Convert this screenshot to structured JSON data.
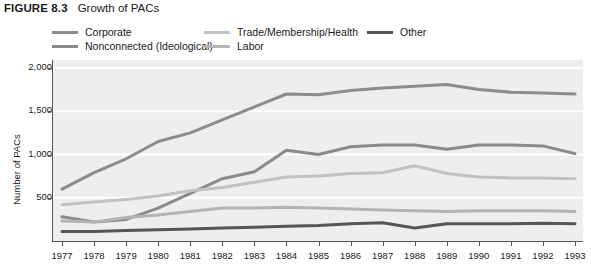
{
  "figure": {
    "number": "FIGURE 8.3",
    "title": "Growth of PACs"
  },
  "legend": {
    "position": "top",
    "items": [
      {
        "label": "Corporate",
        "color": "#8c8c8c"
      },
      {
        "label": "Nonconnected (Ideological)",
        "color": "#8a8a8a"
      },
      {
        "label": "Trade/Membership/Health",
        "color": "#c2c2c2"
      },
      {
        "label": "Labor",
        "color": "#b4b4b4"
      },
      {
        "label": "Other",
        "color": "#555555"
      }
    ]
  },
  "axes": {
    "ylabel": "Number of PACs",
    "yticks": [
      "2,000",
      "1,500",
      "1,000",
      "500"
    ],
    "ytick_values": [
      2000,
      1500,
      1000,
      500
    ],
    "xticks": [
      "1977",
      "1978",
      "1979",
      "1980",
      "1981",
      "1982",
      "1983",
      "1984",
      "1985",
      "1986",
      "1987",
      "1988",
      "1989",
      "1990",
      "1991",
      "1992",
      "1993"
    ]
  },
  "chart_data": {
    "type": "line",
    "title": "Growth of PACs",
    "xlabel": "",
    "ylabel": "Number of PACs",
    "ylim": [
      0,
      2000
    ],
    "grid": true,
    "legend_position": "top",
    "categories": [
      "1977",
      "1978",
      "1979",
      "1980",
      "1981",
      "1982",
      "1983",
      "1984",
      "1985",
      "1986",
      "1987",
      "1988",
      "1989",
      "1990",
      "1991",
      "1992",
      "1993"
    ],
    "series": [
      {
        "name": "Corporate",
        "color": "#8c8c8c",
        "values": [
          600,
          790,
          950,
          1150,
          1250,
          1400,
          1550,
          1700,
          1690,
          1740,
          1770,
          1790,
          1810,
          1750,
          1720,
          1710,
          1700
        ]
      },
      {
        "name": "Nonconnected (Ideological)",
        "color": "#8a8a8a",
        "values": [
          280,
          220,
          250,
          380,
          550,
          720,
          800,
          1050,
          1000,
          1090,
          1110,
          1110,
          1060,
          1110,
          1110,
          1100,
          1010
        ]
      },
      {
        "name": "Trade/Membership/Health",
        "color": "#c2c2c2",
        "values": [
          420,
          450,
          480,
          520,
          580,
          620,
          680,
          740,
          750,
          780,
          790,
          870,
          780,
          740,
          730,
          730,
          720
        ]
      },
      {
        "name": "Labor",
        "color": "#b4b4b4",
        "values": [
          230,
          220,
          270,
          300,
          340,
          380,
          380,
          390,
          380,
          370,
          360,
          350,
          340,
          350,
          350,
          350,
          340
        ]
      },
      {
        "name": "Other",
        "color": "#555555",
        "values": [
          110,
          110,
          120,
          130,
          140,
          150,
          160,
          170,
          180,
          200,
          210,
          150,
          200,
          200,
          200,
          205,
          200
        ]
      }
    ]
  }
}
